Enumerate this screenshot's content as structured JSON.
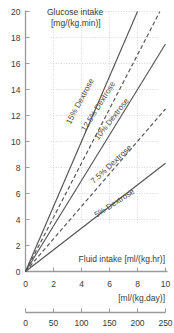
{
  "chart_data": {
    "type": "line",
    "title": "",
    "xlabel": "Fluid intake [ml/(kg.hr)]",
    "ylabel": "Glucose intake [mg/(kg.min)]",
    "ylabel_line1": "Glucose intake",
    "ylabel_line2": "[mg/(kg.min)]",
    "secondary_xlabel": "[ml/(kg.day)]",
    "xlim": [
      0,
      10
    ],
    "ylim": [
      0,
      20
    ],
    "secondary_xlim": [
      0,
      250
    ],
    "xticks": [
      0,
      2,
      4,
      6,
      8,
      10
    ],
    "yticks": [
      0,
      2,
      4,
      6,
      8,
      10,
      12,
      14,
      16,
      18,
      20
    ],
    "secondary_xticks": [
      0,
      50,
      100,
      150,
      200,
      250
    ],
    "grid": true,
    "grid_x": [
      2,
      4,
      6,
      8
    ],
    "grid_y": [
      4,
      6,
      8,
      10,
      12,
      14,
      16,
      18,
      20
    ],
    "legend_position": "inline-labels",
    "note": "Each line passes through the origin; slope = concentration_percent/6 mg/(kg.min) per ml/(kg.hr)",
    "series": [
      {
        "name": "15% Dextrose",
        "label": "15% Dextrose",
        "concentration_percent": 15,
        "style": "solid",
        "slope": 2.5,
        "x": [
          0,
          8
        ],
        "values": [
          0,
          20
        ],
        "label_x": 4.05,
        "label_y": 13.0,
        "label_angle": -62
      },
      {
        "name": "12.5% Dextrose",
        "label": "12.5% Dextrose",
        "concentration_percent": 12.5,
        "style": "dashed",
        "slope": 2.0833,
        "x": [
          0,
          9.6
        ],
        "values": [
          0,
          20
        ],
        "label_x": 5.35,
        "label_y": 12.6,
        "label_angle": -58
      },
      {
        "name": "10% Dextrose",
        "label": "10% Dextrose",
        "concentration_percent": 10,
        "style": "solid",
        "slope": 1.6667,
        "x": [
          0,
          10
        ],
        "values": [
          0,
          17.5
        ],
        "label_x": 6.3,
        "label_y": 11.6,
        "label_angle": -52
      },
      {
        "name": "7.5% Dextrose",
        "label": "7.5% Dextrose",
        "concentration_percent": 7.5,
        "style": "dashed",
        "slope": 1.25,
        "x": [
          0,
          10
        ],
        "values": [
          0,
          12.5
        ],
        "label_x": 6.25,
        "label_y": 8.1,
        "label_angle": -43
      },
      {
        "name": "5% Dextrose",
        "label": "5% Dextrose",
        "concentration_percent": 5,
        "style": "solid",
        "slope": 0.8333,
        "x": [
          0,
          10
        ],
        "values": [
          0,
          8.33
        ],
        "label_x": 6.45,
        "label_y": 5.1,
        "label_angle": -33
      }
    ]
  },
  "colors": {
    "axis": "#9a9a9a",
    "grid": "#c9c4cf",
    "line": "#555355",
    "text": "#3a3a3a",
    "background": "#ffffff"
  }
}
